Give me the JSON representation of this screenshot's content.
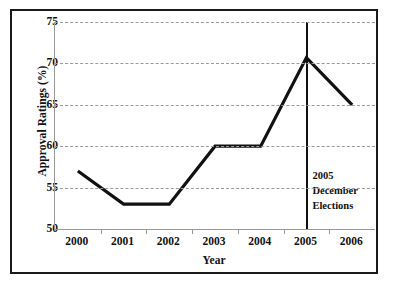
{
  "chart_data": {
    "type": "line",
    "title": "",
    "subtitle": "",
    "xlabel": "Year",
    "ylabel": "Approval Ratings (%)",
    "categories": [
      "2000",
      "2001",
      "2002",
      "2003",
      "2004",
      "2005",
      "2006"
    ],
    "values": [
      57,
      53,
      53,
      60,
      60,
      70.7,
      65
    ],
    "series": [
      {
        "name": "Approval Ratings",
        "values": [
          57,
          53,
          53,
          60,
          60,
          70.7,
          65
        ],
        "color": "#111111"
      }
    ],
    "ylim": [
      50,
      75
    ],
    "yticks": [
      50,
      55,
      60,
      65,
      70,
      75
    ],
    "ytick_labels": [
      "50",
      "55",
      "60",
      "65",
      "70",
      "75"
    ],
    "grid": "horizontal-dashed",
    "legend": "none",
    "annotations": [
      {
        "type": "vertical-line",
        "at_category": "2005",
        "label_lines": [
          "2005",
          "December",
          "Elections"
        ]
      }
    ]
  },
  "axes": {
    "y_title": "Approval Ratings (%)",
    "x_title": "Year"
  },
  "annotation": {
    "line1": "2005",
    "line2": "December",
    "line3": "Elections"
  },
  "caption": {
    "text": ""
  },
  "colors": {
    "line": "#111111",
    "grid": "#9a9a9a",
    "axis": "#999999",
    "frame": "#1a1a1a",
    "text": "#111111",
    "background": "#ffffff"
  }
}
